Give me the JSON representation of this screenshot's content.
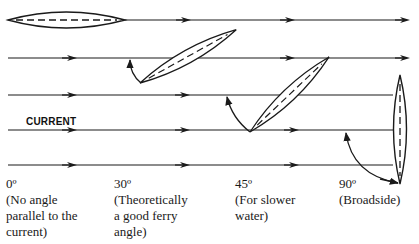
{
  "diagram": {
    "current_label": "CURRENT",
    "angles": [
      {
        "degrees": "0º",
        "description": "(No angle\nparallel to the\ncurrent)"
      },
      {
        "degrees": "30º",
        "description": "(Theoretically\na good ferry\nangle)"
      },
      {
        "degrees": "45º",
        "description": "(For slower\nwater)"
      },
      {
        "degrees": "90º",
        "description": "(Broadside)"
      }
    ],
    "colors": {
      "line": "#1a1a1a",
      "background": "#ffffff"
    }
  }
}
